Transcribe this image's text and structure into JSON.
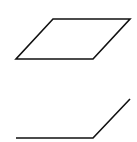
{
  "canvas": {
    "width": 137,
    "height": 142,
    "background": "#ffffff"
  },
  "style": {
    "stroke": "#111111",
    "stroke_width": 1.6
  },
  "shapes": [
    {
      "id": "parallelogram",
      "type": "closed-polygon",
      "points": "53,19 130,19 93,59 16,59"
    },
    {
      "id": "open-polyline",
      "type": "open-polyline",
      "points": "16,138 93,138 130,99"
    }
  ]
}
